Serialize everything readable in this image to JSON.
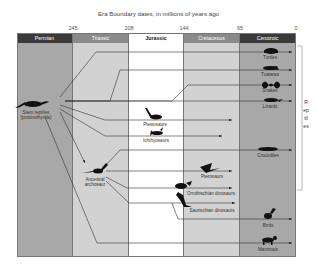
{
  "title": "Era Boundary dates, in millions of years ago",
  "ticks": [
    {
      "label": "245",
      "x": 73
    },
    {
      "label": "208",
      "x": 129
    },
    {
      "label": "144",
      "x": 184
    },
    {
      "label": "65",
      "x": 240
    },
    {
      "label": "0",
      "x": 296
    }
  ],
  "eras": [
    {
      "name": "Permian",
      "color_head": "#3a3a3a",
      "color_body": "#a8a8a8",
      "text_color": "#ffffff"
    },
    {
      "name": "Triassic",
      "color_head": "#8a8a8a",
      "color_body": "#d2d2d2",
      "text_color": "#ffffff"
    },
    {
      "name": "Jurassic",
      "color_head": "#ffffff",
      "color_body": "#ffffff",
      "text_color": "#111111"
    },
    {
      "name": "Cretaceous",
      "color_head": "#8a8a8a",
      "color_body": "#d2d2d2",
      "text_color": "#ffffff"
    },
    {
      "name": "Cenozoic",
      "color_head": "#3a3a3a",
      "color_body": "#a8a8a8",
      "text_color": "#ffffff"
    }
  ],
  "ancestors": {
    "stem": {
      "line1": "Stem reptiles",
      "line2": "(protorothyrids)"
    },
    "archosaur": {
      "line1": "Ancestral",
      "line2": "archosaur"
    }
  },
  "groups": {
    "turtles": "Turtles",
    "tuataras": "Tuataras",
    "snakes": "Snakes",
    "lizards": "Lizards",
    "plesiosaurs": "Plesiosaurs",
    "ichthyosaurs": "Ichthyosaurs",
    "crocodiles": "Crocodiles",
    "pterosaurs": "Pterosaurs",
    "ornithischian": "Ornithischian dinosaurs",
    "saurischian": "Saurischian dinosaurs",
    "birds": "Birds",
    "mammals": "Mammals"
  },
  "bracket_label": "Reptiles"
}
